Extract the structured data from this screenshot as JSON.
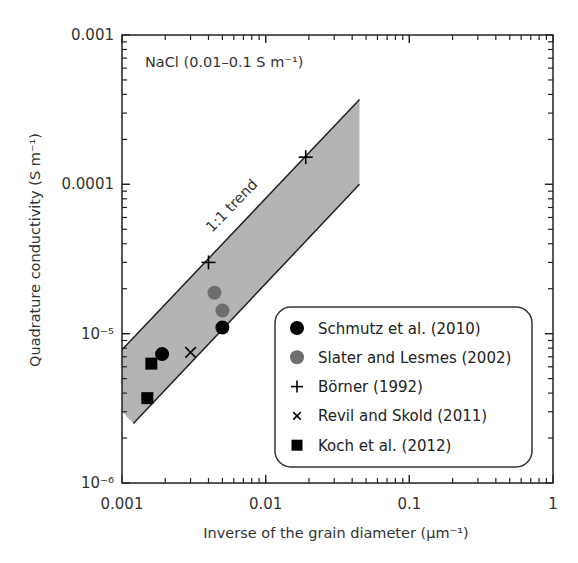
{
  "chart_data": {
    "type": "scatter",
    "title": "",
    "annotation": "NaCl (0.01–0.1 S m⁻¹)",
    "band_label": "1:1 trend",
    "xlabel": "Inverse of the grain diameter  (µm⁻¹)",
    "ylabel": "Quadrature conductivity (S m⁻¹)",
    "xscale": "log",
    "yscale": "log",
    "xlim": [
      0.001,
      1
    ],
    "ylim": [
      1e-06,
      0.001
    ],
    "x_tick_labels": [
      "0.001",
      "0.01",
      "0.1",
      "1"
    ],
    "y_tick_labels": [
      "10⁻⁶",
      "10⁻⁵",
      "0.0001",
      "0.001"
    ],
    "grid": false,
    "legend_position": "lower right (inside)",
    "band": {
      "description": "Shaded 1:1 trend band",
      "color": "#b4b4b4",
      "upper_line": [
        [
          0.001,
          7.8e-06
        ],
        [
          0.045,
          0.00037
        ]
      ],
      "lower_line": [
        [
          0.0012,
          2.5e-06
        ],
        [
          0.045,
          0.0001
        ]
      ]
    },
    "series": [
      {
        "name": "Schmutz et al. (2010)",
        "marker": "circle",
        "color": "#000000",
        "points": [
          [
            0.0019,
            7.3e-06
          ],
          [
            0.005,
            1.1e-05
          ]
        ]
      },
      {
        "name": "Slater and Lesmes (2002)",
        "marker": "circle",
        "color": "#6e6e6e",
        "points": [
          [
            0.0044,
            1.88e-05
          ],
          [
            0.005,
            1.43e-05
          ]
        ]
      },
      {
        "name": "Börner (1992)",
        "marker": "plus",
        "color": "#000000",
        "points": [
          [
            0.004,
            3e-05
          ],
          [
            0.019,
            0.000152
          ]
        ]
      },
      {
        "name": "Revil and Skold (2011)",
        "marker": "x",
        "color": "#000000",
        "points": [
          [
            0.003,
            7.5e-06
          ]
        ]
      },
      {
        "name": "Koch et al. (2012)",
        "marker": "square",
        "color": "#000000",
        "points": [
          [
            0.0016,
            6.3e-06
          ],
          [
            0.0015,
            3.7e-06
          ]
        ]
      }
    ]
  }
}
